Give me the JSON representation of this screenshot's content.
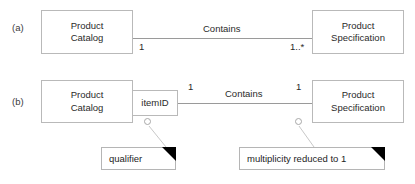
{
  "diagram": {
    "colors": {
      "background": "#ffffff",
      "box_border": "#b9b9b9",
      "line": "#9a9a9a",
      "text": "#2a2a2a",
      "note_fold": "#000000"
    }
  },
  "rows": [
    {
      "id": "a",
      "label": "(a)",
      "source_class": "Product\nCatalog",
      "target_class": "Product\nSpecification",
      "association_name": "Contains",
      "source_multiplicity": "1",
      "target_multiplicity": "1..*"
    },
    {
      "id": "b",
      "label": "(b)",
      "source_class": "Product\nCatalog",
      "target_class": "Product\nSpecification",
      "qualifier": "itemID",
      "association_name": "Contains",
      "source_multiplicity": "1",
      "target_multiplicity": "1"
    }
  ],
  "notes": [
    {
      "id": "qualifier-note",
      "text": "qualifier"
    },
    {
      "id": "multiplicity-note",
      "text": "multiplicity reduced to 1"
    }
  ]
}
